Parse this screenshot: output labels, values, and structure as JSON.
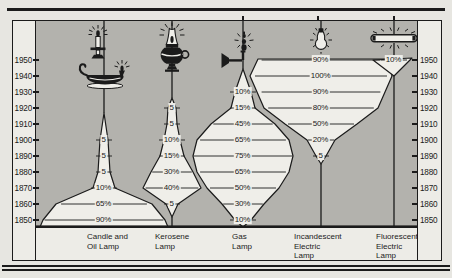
{
  "colors": {
    "page_bg": "#e7e6e1",
    "panel_bg": "#edece7",
    "plot_bg": "#b3b2ad",
    "stream_fill": "#efeee9",
    "line": "#1b1b1b"
  },
  "axis": {
    "years": [
      1950,
      1940,
      1930,
      1920,
      1910,
      1900,
      1890,
      1880,
      1870,
      1860,
      1850
    ]
  },
  "columns": [
    {
      "label": "Candle and\nOil Lamp",
      "icons": [
        "candle-icon",
        "oil-lamp-icon"
      ],
      "points": [
        {
          "year": 1900,
          "value": "5"
        },
        {
          "year": 1890,
          "value": "5"
        },
        {
          "year": 1880,
          "value": "5"
        },
        {
          "year": 1870,
          "value": "10%"
        },
        {
          "year": 1860,
          "value": "65%"
        },
        {
          "year": 1850,
          "value": "90%"
        }
      ]
    },
    {
      "label": "Kerosene\nLamp",
      "icons": [
        "kerosene-lamp-icon"
      ],
      "points": [
        {
          "year": 1920,
          "value": "5"
        },
        {
          "year": 1910,
          "value": "5"
        },
        {
          "year": 1900,
          "value": "10%"
        },
        {
          "year": 1890,
          "value": "15%"
        },
        {
          "year": 1880,
          "value": "30%"
        },
        {
          "year": 1870,
          "value": "40%"
        },
        {
          "year": 1860,
          "value": "5"
        }
      ]
    },
    {
      "label": "Gas\nLamp",
      "icons": [
        "gas-lamp-icon"
      ],
      "points": [
        {
          "year": 1930,
          "value": "10%"
        },
        {
          "year": 1920,
          "value": "15%"
        },
        {
          "year": 1910,
          "value": "45%"
        },
        {
          "year": 1900,
          "value": "65%"
        },
        {
          "year": 1890,
          "value": "75%"
        },
        {
          "year": 1880,
          "value": "65%"
        },
        {
          "year": 1870,
          "value": "50%"
        },
        {
          "year": 1860,
          "value": "30%"
        },
        {
          "year": 1850,
          "value": "10%"
        }
      ]
    },
    {
      "label": "Incandescent\nElectric\nLamp",
      "icons": [
        "light-bulb-icon"
      ],
      "points": [
        {
          "year": 1950,
          "value": "90%"
        },
        {
          "year": 1940,
          "value": "100%"
        },
        {
          "year": 1930,
          "value": "90%"
        },
        {
          "year": 1920,
          "value": "80%"
        },
        {
          "year": 1910,
          "value": "50%"
        },
        {
          "year": 1900,
          "value": "20%"
        },
        {
          "year": 1890,
          "value": "5"
        }
      ]
    },
    {
      "label": "Fluorescent\nElectric\nLamp",
      "icons": [
        "fluorescent-tube-icon"
      ],
      "points": [
        {
          "year": 1950,
          "value": "10%"
        }
      ]
    }
  ],
  "chart_data": {
    "type": "area",
    "title": "",
    "ylabel": "Year",
    "axis_years_range": [
      1850,
      1950
    ],
    "axis_years_step": 10,
    "legend_position": "bottom-column-labels",
    "grid": false,
    "series": [
      {
        "name": "Candle and Oil Lamp",
        "values_pct_by_year": {
          "1850": 90,
          "1860": 65,
          "1870": 10,
          "1880": 5,
          "1890": 5,
          "1900": 5
        }
      },
      {
        "name": "Kerosene Lamp",
        "values_pct_by_year": {
          "1860": 5,
          "1870": 40,
          "1880": 30,
          "1890": 15,
          "1900": 10,
          "1910": 5,
          "1920": 5
        }
      },
      {
        "name": "Gas Lamp",
        "values_pct_by_year": {
          "1850": 10,
          "1860": 30,
          "1870": 50,
          "1880": 65,
          "1890": 75,
          "1900": 65,
          "1910": 45,
          "1920": 15,
          "1930": 10
        }
      },
      {
        "name": "Incandescent Electric Lamp",
        "values_pct_by_year": {
          "1890": 5,
          "1900": 20,
          "1910": 50,
          "1920": 80,
          "1930": 90,
          "1940": 100,
          "1950": 90
        }
      },
      {
        "name": "Fluorescent Electric Lamp",
        "values_pct_by_year": {
          "1950": 10
        }
      }
    ]
  }
}
